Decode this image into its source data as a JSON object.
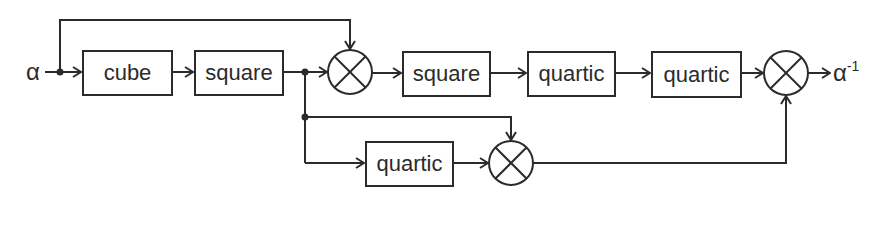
{
  "diagram": {
    "input_label": "α",
    "output_label": "α",
    "output_superscript": "-1",
    "blocks": [
      {
        "id": "cube",
        "label": "cube"
      },
      {
        "id": "square1",
        "label": "square"
      },
      {
        "id": "square2",
        "label": "square"
      },
      {
        "id": "quartic1",
        "label": "quartic"
      },
      {
        "id": "quartic2",
        "label": "quartic"
      },
      {
        "id": "quartic3",
        "label": "quartic"
      }
    ],
    "multipliers": [
      "mult1",
      "mult2",
      "mult3"
    ],
    "colors": {
      "stroke": "#2b2b2b",
      "background": "#ffffff"
    }
  }
}
